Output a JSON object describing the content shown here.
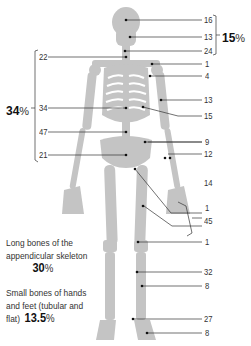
{
  "diagram": {
    "type": "skeleton-bone-distribution",
    "colors": {
      "bone": "#c2c2c2",
      "line": "#333333",
      "text": "#333333"
    }
  },
  "labels_right": [
    {
      "id": "skull-vault",
      "value": "16"
    },
    {
      "id": "face",
      "value": "13"
    },
    {
      "id": "cervical",
      "value": "24"
    },
    {
      "id": "clavicle",
      "value": "1"
    },
    {
      "id": "shoulder",
      "value": "4"
    },
    {
      "id": "humerus",
      "value": "13"
    },
    {
      "id": "ribs",
      "value": "15"
    },
    {
      "id": "ilium",
      "value": "9"
    },
    {
      "id": "forearm",
      "value": "12"
    },
    {
      "id": "hand",
      "value": "14"
    },
    {
      "id": "femur-head",
      "value": "1"
    },
    {
      "id": "femur",
      "value": "45"
    },
    {
      "id": "patella",
      "value": "1"
    },
    {
      "id": "tibia",
      "value": "32"
    },
    {
      "id": "fibula",
      "value": "8"
    },
    {
      "id": "tarsus",
      "value": "27"
    },
    {
      "id": "foot",
      "value": "8"
    }
  ],
  "labels_left": [
    {
      "id": "neck-vertebrae",
      "value": "22"
    },
    {
      "id": "thoracic",
      "value": "34"
    },
    {
      "id": "lumbar",
      "value": "47"
    },
    {
      "id": "sacrum",
      "value": "21"
    }
  ],
  "groups": {
    "skull": {
      "percent": "15",
      "sign": "%"
    },
    "axial": {
      "percent": "34",
      "sign": "%"
    }
  },
  "captions": {
    "long_bones": {
      "line1": "Long bones of the",
      "line2": "appendicular skeleton",
      "percent": "30",
      "sign": "%"
    },
    "small_bones": {
      "line1": "Small bones of hands",
      "line2": "and feet (tubular and",
      "line3": "flat)",
      "percent": "13.5",
      "sign": "%"
    }
  }
}
